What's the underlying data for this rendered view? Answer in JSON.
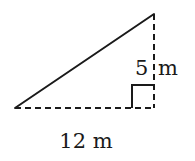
{
  "diagram": {
    "type": "right-triangle",
    "labels": {
      "height": "5 m",
      "height_value": "5",
      "height_unit": "m",
      "base": "12 m"
    },
    "colors": {
      "stroke": "#1a1a1a",
      "background": "#ffffff"
    }
  }
}
